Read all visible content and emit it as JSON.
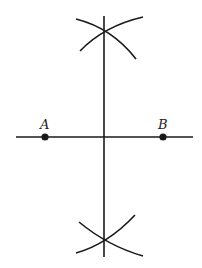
{
  "diagram": {
    "colors": {
      "stroke": "#1a1a1a",
      "background": "#ffffff"
    },
    "points": [
      {
        "label": "A",
        "x": 45,
        "y": 137
      },
      {
        "label": "B",
        "x": 163,
        "y": 137
      }
    ],
    "labels": {
      "A": "A",
      "B": "B"
    },
    "lines": {
      "segment_line": {
        "x1": 16,
        "y1": 137,
        "x2": 193,
        "y2": 137
      },
      "bisector": {
        "x1": 104,
        "y1": 16,
        "x2": 104,
        "y2": 257
      }
    },
    "intersections": {
      "top": {
        "x": 104,
        "y": 32
      },
      "bottom": {
        "x": 104,
        "y": 241
      }
    }
  }
}
